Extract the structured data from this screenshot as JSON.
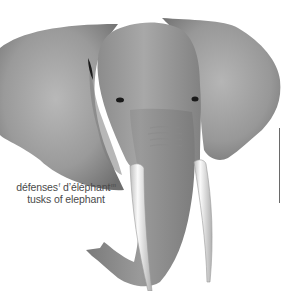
{
  "illustration": {
    "subject": "elephant head (front view)",
    "parts": [
      "left-ear",
      "right-ear",
      "head",
      "eyes",
      "trunk",
      "left-tusk",
      "right-tusk"
    ]
  },
  "labels": {
    "french": {
      "word1": "défenses",
      "word1_gender": "f",
      "word2": "d’éléphant",
      "word2_gender": "m"
    },
    "english": "tusks of elephant"
  },
  "colors": {
    "skin_light": "#b4b4b4",
    "skin_mid": "#8f8f8f",
    "skin_dark": "#6a6a6a",
    "tusk": "#f0f0f0",
    "text": "#4a4a4a"
  }
}
